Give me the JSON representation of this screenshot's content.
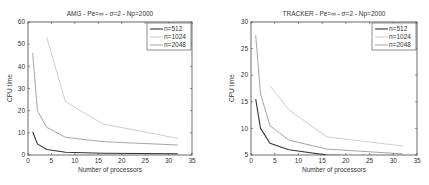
{
  "chart_data": [
    {
      "type": "line",
      "title": "AMG - Pe=∞ - σ=2 - Np=2000",
      "xlabel": "Number of processors",
      "ylabel": "CPU time",
      "xlim": [
        0,
        35
      ],
      "ylim": [
        0,
        60
      ],
      "xticks": [
        0,
        5,
        10,
        15,
        20,
        25,
        30,
        35
      ],
      "yticks": [
        0,
        10,
        20,
        30,
        40,
        50,
        60
      ],
      "grid": false,
      "legend_position": "upper right",
      "series": [
        {
          "name": "n=512",
          "color": "#333333",
          "width": 1.1,
          "x": [
            1,
            2,
            4,
            8,
            16,
            32
          ],
          "y": [
            10.5,
            5,
            2.5,
            1.2,
            0.8,
            0.6
          ]
        },
        {
          "name": "n=1024",
          "color": "#c8c8c8",
          "width": 0.9,
          "x": [
            4,
            8,
            16,
            32
          ],
          "y": [
            53,
            24,
            14,
            7.5
          ]
        },
        {
          "name": "n=2048",
          "color": "#9a9a9a",
          "width": 0.9,
          "x": [
            1,
            2,
            4,
            8,
            16,
            32
          ],
          "y": [
            46,
            20,
            12.5,
            8,
            6,
            4.5
          ]
        }
      ]
    },
    {
      "type": "line",
      "title": "TRACKER - Pe=∞ - σ=2 - Np=2000",
      "xlabel": "Number of processors",
      "ylabel": "CPU time",
      "xlim": [
        0,
        35
      ],
      "ylim": [
        5,
        30
      ],
      "xticks": [
        0,
        5,
        10,
        15,
        20,
        25,
        30,
        35
      ],
      "yticks": [
        5,
        10,
        15,
        20,
        25,
        30
      ],
      "grid": false,
      "legend_position": "upper right",
      "series": [
        {
          "name": "n=512",
          "color": "#333333",
          "width": 1.1,
          "x": [
            1,
            2,
            4,
            8,
            16,
            32
          ],
          "y": [
            15.5,
            10,
            7.2,
            6,
            5,
            4.5
          ]
        },
        {
          "name": "n=1024",
          "color": "#c8c8c8",
          "width": 0.9,
          "x": [
            4,
            8,
            16,
            32
          ],
          "y": [
            18,
            13.5,
            8.4,
            6.7
          ]
        },
        {
          "name": "n=2048",
          "color": "#9a9a9a",
          "width": 0.9,
          "x": [
            1,
            2,
            4,
            8,
            16,
            32
          ],
          "y": [
            27.5,
            16.5,
            10.5,
            7.8,
            6.1,
            5.2
          ]
        }
      ]
    }
  ]
}
